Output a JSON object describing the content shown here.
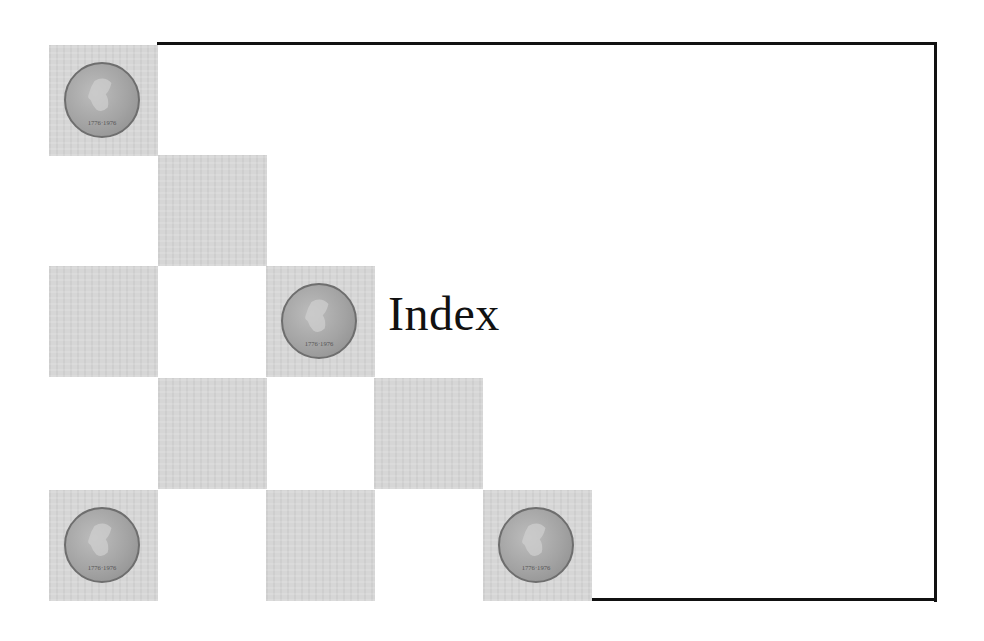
{
  "slide": {
    "title": "Index",
    "colors": {
      "border": "#111111",
      "cell": "#d6d6d6",
      "coin": "#a3a3a3",
      "background": "#ffffff"
    },
    "grid": {
      "columns_x": [
        49,
        158,
        266,
        374,
        483
      ],
      "rows_y": [
        45,
        155,
        266,
        378,
        490
      ],
      "cells": [
        {
          "col": 0,
          "row": 0,
          "coin": true
        },
        {
          "col": 1,
          "row": 1,
          "coin": false
        },
        {
          "col": 0,
          "row": 2,
          "coin": false
        },
        {
          "col": 2,
          "row": 2,
          "coin": true
        },
        {
          "col": 1,
          "row": 3,
          "coin": false
        },
        {
          "col": 3,
          "row": 3,
          "coin": false
        },
        {
          "col": 0,
          "row": 4,
          "coin": true
        },
        {
          "col": 2,
          "row": 4,
          "coin": false
        },
        {
          "col": 4,
          "row": 4,
          "coin": true
        }
      ]
    },
    "coin_icon": "half-dollar-coin-icon",
    "coin_text": {
      "top": "LIBERTY",
      "bottom": "1776-1976",
      "left": "IN GOD",
      "right": "WE TRUST"
    }
  }
}
